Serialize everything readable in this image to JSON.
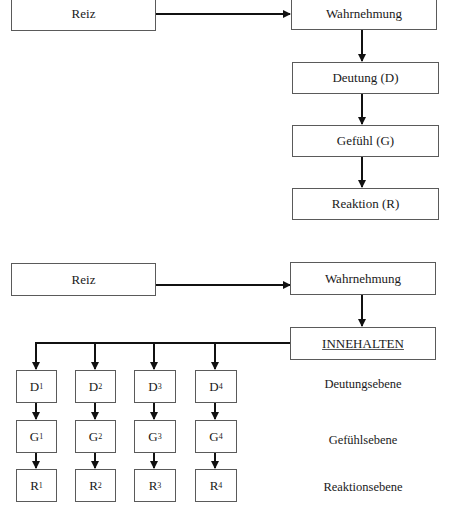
{
  "diagram1": {
    "reiz": "Reiz",
    "wahrnehmung": "Wahrnehmung",
    "deutung": "Deutung (D)",
    "gefuehl": "Gefühl (G)",
    "reaktion": "Reaktion (R)"
  },
  "diagram2": {
    "reiz": "Reiz",
    "wahrnehmung": "Wahrnehmung",
    "innehalten": "INNEHALTEN",
    "columns": [
      {
        "d": "D",
        "g": "G",
        "r": "R",
        "idx": "1"
      },
      {
        "d": "D",
        "g": "G",
        "r": "R",
        "idx": "2"
      },
      {
        "d": "D",
        "g": "G",
        "r": "R",
        "idx": "3"
      },
      {
        "d": "D",
        "g": "G",
        "r": "R",
        "idx": "4"
      }
    ],
    "levels": {
      "deutung": "Deutungsebene",
      "gefuehl": "Gefühlsebene",
      "reaktion": "Reaktionsebene"
    }
  }
}
